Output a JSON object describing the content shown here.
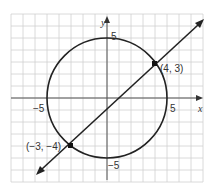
{
  "chart_data": {
    "type": "line",
    "title": "",
    "xlabel": "x",
    "ylabel": "y",
    "xlim": [
      -8,
      8
    ],
    "ylim": [
      -7,
      7
    ],
    "grid": true,
    "tick_labels": {
      "x": [
        {
          "value": -5,
          "label": "−5"
        },
        {
          "value": 5,
          "label": "5"
        }
      ],
      "y": [
        {
          "value": 5,
          "label": "5"
        },
        {
          "value": -5,
          "label": "−5"
        }
      ]
    },
    "series": [
      {
        "name": "circle",
        "kind": "circle",
        "center": [
          0,
          0
        ],
        "radius": 5,
        "equation": "x^2 + y^2 = 25"
      },
      {
        "name": "line",
        "kind": "line",
        "slope": 1,
        "intercept": -1,
        "equation": "y = x - 1",
        "arrows": "both"
      }
    ],
    "points": [
      {
        "x": 4,
        "y": 3,
        "label": "(4, 3)"
      },
      {
        "x": -3,
        "y": -4,
        "label": "(−3, −4)"
      }
    ]
  },
  "labels": {
    "x_axis": "x",
    "y_axis": "y",
    "x_neg5": "−5",
    "x_pos5": "5",
    "y_pos5": "5",
    "y_neg5": "−5",
    "point_a": "(4, 3)",
    "point_b": "(−3, −4)"
  },
  "colors": {
    "grid": "#d0d0d0",
    "axis": "#555555",
    "curve": "#222222",
    "background": "#ffffff"
  }
}
